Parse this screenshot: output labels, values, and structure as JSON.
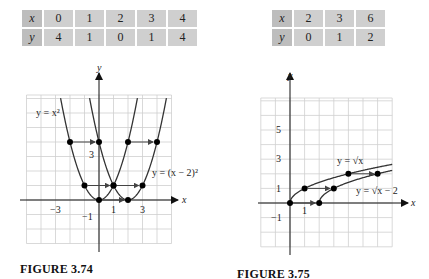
{
  "chart_data": [
    {
      "type": "line",
      "title": "FIGURE 3.74",
      "table": {
        "headers": [
          "x",
          "y"
        ],
        "x": [
          0,
          1,
          2,
          3,
          4
        ],
        "y": [
          4,
          1,
          0,
          1,
          4
        ]
      },
      "series": [
        {
          "name": "y = x^2",
          "label": "y = x²",
          "points": [
            [
              -2,
              4
            ],
            [
              -1,
              1
            ],
            [
              0,
              0
            ],
            [
              1,
              1
            ],
            [
              2,
              4
            ]
          ]
        },
        {
          "name": "y = (x - 2)^2",
          "label": "y = (x − 2)²",
          "points": [
            [
              0,
              4
            ],
            [
              1,
              1
            ],
            [
              2,
              0
            ],
            [
              3,
              1
            ],
            [
              4,
              4
            ]
          ]
        }
      ],
      "arrows": [
        [
          [
            -2,
            4
          ],
          [
            0,
            4
          ]
        ],
        [
          [
            2,
            4
          ],
          [
            4,
            4
          ]
        ],
        [
          [
            -1,
            1
          ],
          [
            1,
            1
          ]
        ],
        [
          [
            1,
            1
          ],
          [
            3,
            1
          ]
        ],
        [
          [
            0,
            0
          ],
          [
            2,
            0
          ]
        ]
      ],
      "xlabel": "x",
      "ylabel": "y",
      "x_ticks_labeled": [
        "-3",
        "1",
        "3"
      ],
      "y_ticks_labeled": [
        "3",
        "-1"
      ],
      "xlim": [
        -5,
        5
      ],
      "ylim": [
        -3,
        7
      ],
      "grid": true
    },
    {
      "type": "line",
      "title": "FIGURE 3.75",
      "table": {
        "headers": [
          "x",
          "y"
        ],
        "x": [
          2,
          3,
          6
        ],
        "y": [
          0,
          1,
          2
        ]
      },
      "series": [
        {
          "name": "y = sqrt(x)",
          "label": "y = √x",
          "points": [
            [
              0,
              0
            ],
            [
              1,
              1
            ],
            [
              4,
              2
            ]
          ]
        },
        {
          "name": "y = sqrt(x - 2)",
          "label": "y = √x − 2",
          "points": [
            [
              2,
              0
            ],
            [
              3,
              1
            ],
            [
              6,
              2
            ]
          ]
        }
      ],
      "arrows": [
        [
          [
            0,
            0
          ],
          [
            2,
            0
          ]
        ],
        [
          [
            1,
            1
          ],
          [
            3,
            1
          ]
        ],
        [
          [
            4,
            2
          ],
          [
            6,
            2
          ]
        ]
      ],
      "xlabel": "x",
      "ylabel": "y",
      "x_ticks_labeled": [
        "1"
      ],
      "y_ticks_labeled": [
        "5",
        "3",
        "1",
        "-1"
      ],
      "xlim": [
        -2,
        7
      ],
      "ylim": [
        -3,
        7
      ],
      "grid": true
    }
  ],
  "left": {
    "table": {
      "x_label": "x",
      "y_label": "y",
      "x": [
        "0",
        "1",
        "2",
        "3",
        "4"
      ],
      "y": [
        "4",
        "1",
        "0",
        "1",
        "4"
      ]
    },
    "caption": "FIGURE 3.74",
    "axis_x": "x",
    "axis_y": "y",
    "curve1_label": "y = x²",
    "curve2_label": "y = (x − 2)²",
    "tick_neg3": "−3",
    "tick_1": "1",
    "tick_3x": "3",
    "tick_3y": "3",
    "tick_neg1": "−1"
  },
  "right": {
    "table": {
      "x_label": "x",
      "y_label": "y",
      "x": [
        "2",
        "3",
        "6"
      ],
      "y": [
        "0",
        "1",
        "2"
      ]
    },
    "caption": "FIGURE 3.75",
    "axis_x": "x",
    "axis_y": "y",
    "curve1_label": "y = √x",
    "curve2_label": "y = √x − 2",
    "tick_5": "5",
    "tick_3": "3",
    "tick_1y": "1",
    "tick_neg1": "−1",
    "tick_1x": "1"
  }
}
